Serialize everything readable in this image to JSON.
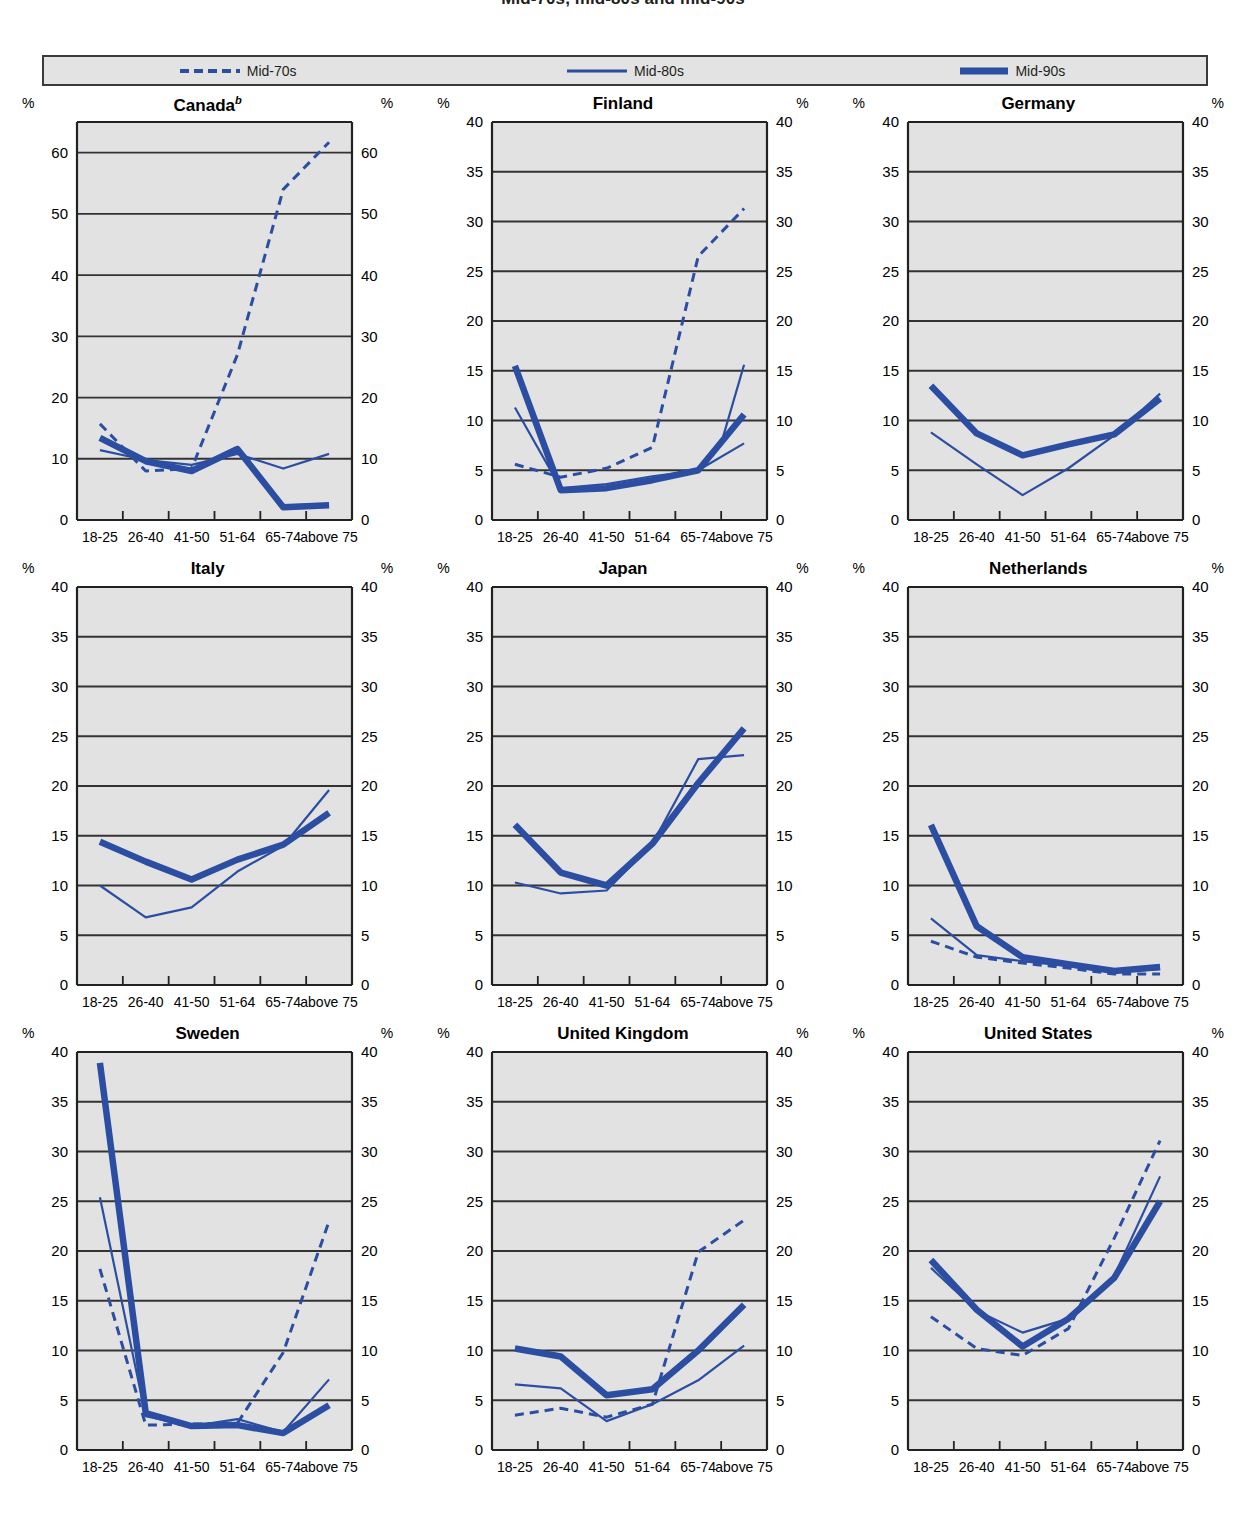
{
  "header": {
    "title": "Mid-70s, mid-80s and mid-90s"
  },
  "legend": {
    "items": [
      {
        "label": "Mid-70s",
        "style": "dashed",
        "icon": "dashed-line-icon"
      },
      {
        "label": "Mid-80s",
        "style": "thin",
        "icon": "thin-line-icon"
      },
      {
        "label": "Mid-90s",
        "style": "thick",
        "icon": "thick-line-icon"
      }
    ]
  },
  "axis": {
    "unit_label": "%",
    "categories": [
      "18-25",
      "26-40",
      "41-50",
      "51-64",
      "65-74",
      "above 75"
    ]
  },
  "colors": {
    "series_blue": "#2b4ea2",
    "plot_background": "#e2e2e2",
    "grid_line": "#333333",
    "frame": "#222222",
    "text": "#000000",
    "legend_background": "#e3e3e3"
  },
  "chart_data": {
    "type": "line",
    "title": "Mid-70s, mid-80s and mid-90s",
    "xlabel": "",
    "ylabel": "%",
    "grid": true,
    "legend_position": "top",
    "categories": [
      "18-25",
      "26-40",
      "41-50",
      "51-64",
      "65-74",
      "above 75"
    ],
    "panels": [
      {
        "title": "Canada",
        "title_superscript": "b",
        "ylim": [
          0,
          65
        ],
        "yticks": [
          0,
          10,
          20,
          30,
          40,
          50,
          60
        ],
        "series": [
          {
            "name": "Mid-70s",
            "style": "dashed",
            "values": [
              15.7,
              8.0,
              8.4,
              27.0,
              54.0,
              61.7
            ]
          },
          {
            "name": "Mid-80s",
            "style": "thin",
            "values": [
              11.4,
              9.8,
              9.0,
              10.8,
              8.4,
              10.8
            ]
          },
          {
            "name": "Mid-90s",
            "style": "thick",
            "values": [
              13.4,
              9.6,
              8.0,
              11.6,
              2.1,
              2.4
            ]
          }
        ]
      },
      {
        "title": "Finland",
        "title_superscript": "",
        "ylim": [
          0,
          40
        ],
        "yticks": [
          0,
          5,
          10,
          15,
          20,
          25,
          30,
          35,
          40
        ],
        "series": [
          {
            "name": "Mid-70s",
            "style": "dashed",
            "values": [
              5.6,
              4.3,
              5.2,
              7.3,
              26.5,
              31.3
            ]
          },
          {
            "name": "Mid-80s",
            "style": "thin",
            "values": [
              11.3,
              3.2,
              3.6,
              4.4,
              5.0,
              7.7
            ]
          },
          {
            "name": "Mid-90s",
            "style": "thick",
            "values": [
              15.5,
              3.0,
              3.2,
              4.0,
              5.0,
              10.6
            ]
          }
        ],
        "series_extra": [
          {
            "name": "Mid-80s-tail",
            "style": "thin",
            "from_index": 4,
            "values": [
              5.0,
              7.7,
              15.6
            ]
          }
        ]
      },
      {
        "title": "Germany",
        "title_superscript": "",
        "ylim": [
          0,
          40
        ],
        "yticks": [
          0,
          5,
          10,
          15,
          20,
          25,
          30,
          35,
          40
        ],
        "series": [
          {
            "name": "Mid-80s",
            "style": "thin",
            "values": [
              8.8,
              5.6,
              2.5,
              5.2,
              8.5,
              12.7
            ]
          },
          {
            "name": "Mid-90s",
            "style": "thick",
            "values": [
              13.5,
              8.7,
              6.5,
              7.6,
              8.6,
              12.2
            ]
          }
        ]
      },
      {
        "title": "Italy",
        "title_superscript": "",
        "ylim": [
          0,
          40
        ],
        "yticks": [
          0,
          5,
          10,
          15,
          20,
          25,
          30,
          35,
          40
        ],
        "series": [
          {
            "name": "Mid-80s",
            "style": "thin",
            "values": [
              10.0,
              6.8,
              7.8,
              11.4,
              14.0,
              19.6
            ]
          },
          {
            "name": "Mid-90s",
            "style": "thick",
            "values": [
              14.4,
              12.4,
              10.6,
              12.6,
              14.1,
              17.3
            ]
          }
        ]
      },
      {
        "title": "Japan",
        "title_superscript": "",
        "ylim": [
          0,
          40
        ],
        "yticks": [
          0,
          5,
          10,
          15,
          20,
          25,
          30,
          35,
          40
        ],
        "series": [
          {
            "name": "Mid-80s",
            "style": "thin",
            "values": [
              10.3,
              9.2,
              9.5,
              14.2,
              22.7,
              23.1
            ]
          },
          {
            "name": "Mid-90s",
            "style": "thick",
            "values": [
              16.1,
              11.3,
              10.0,
              14.2,
              20.3,
              25.8
            ]
          }
        ]
      },
      {
        "title": "Netherlands",
        "title_superscript": "",
        "ylim": [
          0,
          40
        ],
        "yticks": [
          0,
          5,
          10,
          15,
          20,
          25,
          30,
          35,
          40
        ],
        "series": [
          {
            "name": "Mid-70s",
            "style": "dashed",
            "values": [
              4.4,
              2.8,
              2.2,
              1.7,
              1.1,
              1.1
            ]
          },
          {
            "name": "Mid-80s",
            "style": "thin",
            "values": [
              6.7,
              3.0,
              2.4,
              1.9,
              1.3,
              1.6
            ]
          },
          {
            "name": "Mid-90s",
            "style": "thick",
            "values": [
              16.1,
              5.9,
              2.8,
              2.1,
              1.4,
              1.8
            ]
          }
        ]
      },
      {
        "title": "Sweden",
        "title_superscript": "",
        "ylim": [
          0,
          40
        ],
        "yticks": [
          0,
          5,
          10,
          15,
          20,
          25,
          30,
          35,
          40
        ],
        "series": [
          {
            "name": "Mid-70s",
            "style": "dashed",
            "values": [
              18.2,
              2.5,
              2.6,
              2.7,
              9.8,
              23.0
            ]
          },
          {
            "name": "Mid-80s",
            "style": "thin",
            "values": [
              25.4,
              3.4,
              2.4,
              3.1,
              1.8,
              7.1
            ]
          },
          {
            "name": "Mid-90s",
            "style": "thick",
            "values": [
              38.9,
              3.7,
              2.4,
              2.5,
              1.7,
              4.5
            ]
          }
        ]
      },
      {
        "title": "United Kingdom",
        "title_superscript": "",
        "ylim": [
          0,
          40
        ],
        "yticks": [
          0,
          5,
          10,
          15,
          20,
          25,
          30,
          35,
          40
        ],
        "series": [
          {
            "name": "Mid-70s",
            "style": "dashed",
            "values": [
              3.5,
              4.2,
              3.3,
              4.6,
              19.9,
              23.1
            ]
          },
          {
            "name": "Mid-80s",
            "style": "thin",
            "values": [
              6.6,
              6.2,
              2.9,
              4.6,
              7.0,
              10.5
            ]
          },
          {
            "name": "Mid-90s",
            "style": "thick",
            "values": [
              10.2,
              9.4,
              5.5,
              6.1,
              10.0,
              14.6
            ]
          }
        ]
      },
      {
        "title": "United States",
        "title_superscript": "",
        "ylim": [
          0,
          40
        ],
        "yticks": [
          0,
          5,
          10,
          15,
          20,
          25,
          30,
          35,
          40
        ],
        "series": [
          {
            "name": "Mid-70s",
            "style": "dashed",
            "values": [
              13.4,
              10.2,
              9.5,
              12.2,
              21.3,
              31.1
            ]
          },
          {
            "name": "Mid-80s",
            "style": "thin",
            "values": [
              18.3,
              14.0,
              11.8,
              13.2,
              17.5,
              27.5
            ]
          },
          {
            "name": "Mid-90s",
            "style": "thick",
            "values": [
              19.1,
              14.1,
              10.4,
              13.2,
              17.3,
              25.0
            ]
          }
        ]
      }
    ]
  }
}
